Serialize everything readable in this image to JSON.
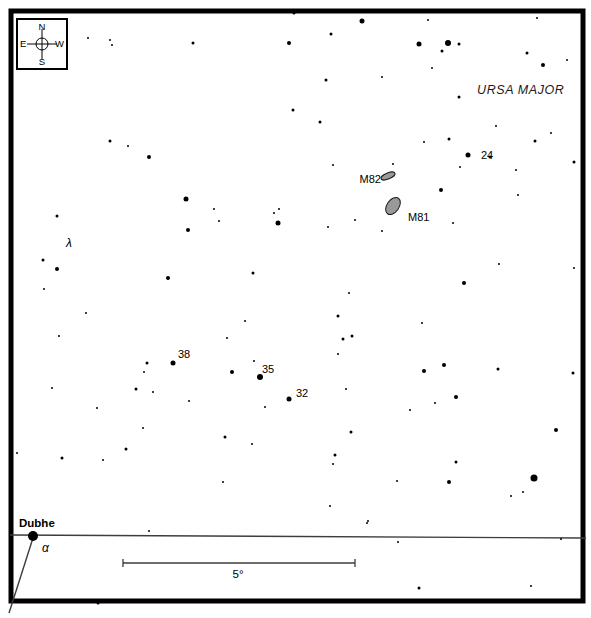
{
  "page": {
    "background": "#ffffff",
    "ink": "#000000"
  },
  "compass": {
    "n": "N",
    "e": "E",
    "s": "S",
    "w": "W"
  },
  "constellation_label": "URSA MAJOR",
  "chart_data": {
    "type": "scatter",
    "colors": {
      "star": "#000000",
      "galaxy_fill": "#999999",
      "galaxy_stroke": "#1a1a1a",
      "line": "#3d3d3d",
      "frame": "#000000"
    },
    "frame": {
      "x": 11,
      "y": 11,
      "width": 572,
      "height": 590,
      "stroke_width": 5
    },
    "stars": [
      [
        88,
        38,
        1
      ],
      [
        110,
        40,
        1
      ],
      [
        112,
        45,
        1
      ],
      [
        193,
        43,
        1.5
      ],
      [
        294,
        13,
        1.5
      ],
      [
        362,
        21,
        2.5
      ],
      [
        331,
        34,
        1.5
      ],
      [
        289,
        43,
        2
      ],
      [
        326,
        80,
        1.5
      ],
      [
        382,
        77,
        1
      ],
      [
        293,
        110,
        1.5
      ],
      [
        428,
        20,
        1
      ],
      [
        537,
        18,
        1
      ],
      [
        419,
        44,
        2.5
      ],
      [
        448,
        43,
        3
      ],
      [
        459,
        44,
        1.5
      ],
      [
        442,
        51,
        1.5
      ],
      [
        527,
        53,
        1.5
      ],
      [
        567,
        60,
        1
      ],
      [
        432,
        68,
        1
      ],
      [
        543,
        65,
        2
      ],
      [
        459,
        97,
        1.5
      ],
      [
        110,
        141,
        1.5
      ],
      [
        128,
        146,
        1
      ],
      [
        149,
        157,
        2
      ],
      [
        186,
        199,
        2.5
      ],
      [
        320,
        122,
        1.5
      ],
      [
        333,
        165,
        1
      ],
      [
        214,
        209,
        1
      ],
      [
        279,
        209,
        1
      ],
      [
        274,
        213,
        1
      ],
      [
        219,
        221,
        1
      ],
      [
        278,
        223,
        2.5
      ],
      [
        188,
        230,
        2
      ],
      [
        328,
        227,
        1
      ],
      [
        496,
        126,
        1
      ],
      [
        551,
        133,
        1
      ],
      [
        535,
        141,
        1.5
      ],
      [
        574,
        162,
        1.5
      ],
      [
        516,
        170,
        1
      ],
      [
        518,
        195,
        1
      ],
      [
        490,
        157,
        1.5
      ],
      [
        424,
        142,
        1
      ],
      [
        449,
        139,
        1.5
      ],
      [
        468,
        155,
        2.5
      ],
      [
        460,
        167,
        1
      ],
      [
        393,
        164,
        1
      ],
      [
        441,
        190,
        2
      ],
      [
        355,
        220,
        1
      ],
      [
        453,
        223,
        1
      ],
      [
        382,
        231,
        1
      ],
      [
        57,
        216,
        1.5
      ],
      [
        43,
        260,
        1.5
      ],
      [
        57,
        269,
        2
      ],
      [
        168,
        278,
        2
      ],
      [
        44,
        289,
        1
      ],
      [
        253,
        273,
        1.5
      ],
      [
        349,
        293,
        1
      ],
      [
        338,
        316,
        1.5
      ],
      [
        245,
        321,
        1
      ],
      [
        352,
        336,
        1.5
      ],
      [
        343,
        339,
        1.5
      ],
      [
        499,
        264,
        1
      ],
      [
        574,
        268,
        1
      ],
      [
        464,
        283,
        2
      ],
      [
        422,
        323,
        1
      ],
      [
        86,
        313,
        1
      ],
      [
        59,
        336,
        1
      ],
      [
        52,
        388,
        1
      ],
      [
        97,
        408,
        1
      ],
      [
        227,
        338,
        1
      ],
      [
        173,
        363,
        2.5
      ],
      [
        147,
        363,
        1.5
      ],
      [
        144,
        372,
        1
      ],
      [
        232,
        372,
        2
      ],
      [
        254,
        361,
        1
      ],
      [
        260,
        377,
        3
      ],
      [
        136,
        389,
        1.5
      ],
      [
        153,
        392,
        1
      ],
      [
        289,
        399,
        2.5
      ],
      [
        265,
        407,
        1
      ],
      [
        189,
        401,
        1
      ],
      [
        143,
        428,
        1
      ],
      [
        225,
        437,
        1.5
      ],
      [
        338,
        354,
        1
      ],
      [
        424,
        371,
        2
      ],
      [
        444,
        365,
        2
      ],
      [
        498,
        369,
        1.5
      ],
      [
        573,
        373,
        1.5
      ],
      [
        346,
        389,
        1
      ],
      [
        456,
        397,
        2
      ],
      [
        435,
        403,
        1
      ],
      [
        410,
        410,
        1
      ],
      [
        351,
        432,
        1.5
      ],
      [
        556,
        430,
        2
      ],
      [
        335,
        455,
        1.5
      ],
      [
        333,
        464,
        1
      ],
      [
        456,
        462,
        1.5
      ],
      [
        397,
        481,
        1
      ],
      [
        449,
        482,
        2
      ],
      [
        534,
        478,
        3.5
      ],
      [
        511,
        496,
        1
      ],
      [
        523,
        492,
        1
      ],
      [
        330,
        506,
        1
      ],
      [
        368,
        521,
        1
      ],
      [
        17,
        453,
        1
      ],
      [
        62,
        458,
        1.5
      ],
      [
        103,
        460,
        1
      ],
      [
        126,
        449,
        1.5
      ],
      [
        252,
        444,
        1
      ],
      [
        223,
        482,
        1
      ],
      [
        149,
        531,
        1
      ],
      [
        367,
        523,
        1
      ],
      [
        398,
        542,
        1
      ],
      [
        561,
        539,
        1
      ],
      [
        98,
        603,
        1.5
      ],
      [
        263,
        602,
        1
      ],
      [
        348,
        601,
        1
      ],
      [
        419,
        588,
        1.5
      ],
      [
        531,
        586,
        1
      ]
    ],
    "named_star": {
      "name": "Dubhe",
      "x": 33,
      "y": 536,
      "r": 5
    },
    "galaxies": [
      {
        "id": "m82",
        "label": "M82",
        "cx": 388,
        "cy": 176,
        "rx": 7.5,
        "ry": 3,
        "rot": -22,
        "label_x": 381,
        "label_y": 183,
        "anchor": "end"
      },
      {
        "id": "m81",
        "label": "M81",
        "cx": 393,
        "cy": 206,
        "rx": 6,
        "ry": 9.5,
        "rot": 35,
        "label_x": 408,
        "label_y": 221,
        "anchor": "start"
      }
    ],
    "star_labels": [
      {
        "name": "label-star-24",
        "text": "24",
        "x": 481,
        "y": 159,
        "style": "lbl"
      },
      {
        "name": "label-star-38",
        "text": "38",
        "x": 178,
        "y": 358,
        "style": "lbl"
      },
      {
        "name": "label-star-35",
        "text": "35",
        "x": 262,
        "y": 373,
        "style": "lbl"
      },
      {
        "name": "label-star-32",
        "text": "32",
        "x": 296,
        "y": 397,
        "style": "lbl"
      },
      {
        "name": "label-star-lambda",
        "text": "λ",
        "x": 66,
        "y": 247,
        "style": "lbl-italic"
      },
      {
        "name": "label-star-alpha",
        "text": "α",
        "x": 42,
        "y": 552,
        "style": "lbl-italic"
      },
      {
        "name": "label-star-dubhe",
        "text": "Dubhe",
        "x": 19,
        "y": 527,
        "style": "lbl-bold"
      }
    ],
    "scale_bar": {
      "x1": 123,
      "x2": 355,
      "y": 563,
      "tick_half_height": 4,
      "label": "5°",
      "label_x": 238,
      "label_y": 578
    },
    "boundary_line": {
      "x1": 10,
      "y1": 535,
      "x2": 586,
      "y2": 538
    },
    "pointer_line": {
      "x1": 33,
      "y1": 538,
      "x2": 9,
      "y2": 613
    }
  }
}
